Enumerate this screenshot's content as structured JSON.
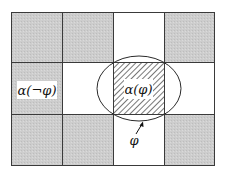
{
  "diagram": {
    "grid": {
      "columns": 4,
      "rows": 3,
      "cells": [
        [
          "shaded",
          "shaded",
          "white",
          "shaded"
        ],
        [
          "shaded",
          "white",
          "hatched",
          "white"
        ],
        [
          "shaded",
          "shaded",
          "white",
          "shaded"
        ]
      ]
    },
    "labels": {
      "neg_phi": "α(¬φ)",
      "phi_cell": "α(φ)",
      "phi_region": "φ"
    },
    "colors": {
      "shaded": "#cdcdcd",
      "line": "#3a3a3a",
      "hatch": "#555555",
      "white": "#ffffff"
    }
  }
}
